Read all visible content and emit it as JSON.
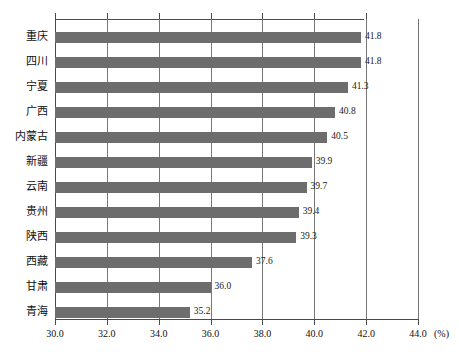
{
  "chart_data": {
    "type": "bar",
    "orientation": "horizontal",
    "title": "",
    "subtitle": "",
    "xlabel": "(%)",
    "ylabel": "",
    "categories": [
      "重庆",
      "四川",
      "宁夏",
      "广西",
      "内蒙古",
      "新疆",
      "云南",
      "贵州",
      "陕西",
      "西藏",
      "甘肃",
      "青海"
    ],
    "values": [
      41.8,
      41.8,
      41.3,
      40.8,
      40.5,
      39.9,
      39.7,
      39.4,
      39.3,
      37.6,
      36.0,
      35.2
    ],
    "data_labels": [
      "41.8",
      "41.8",
      "41.3",
      "40.8",
      "40.5",
      "39.9",
      "39.7",
      "39.4",
      "39.3",
      "37.6",
      "36.0",
      "35.2"
    ],
    "xlim": [
      30.0,
      44.0
    ],
    "xticks": [
      30.0,
      32.0,
      34.0,
      36.0,
      38.0,
      40.0,
      42.0,
      44.0
    ],
    "xtick_labels": [
      "30.0",
      "32.0",
      "34.0",
      "36.0",
      "38.0",
      "40.0",
      "42.0",
      "44.0"
    ],
    "unit_label": "(%)",
    "grid": true,
    "grid_axis": "x",
    "legend": null,
    "bar_color": "#6d6d6d",
    "axis_color": "#4a4a4a",
    "grid_color": "#777777",
    "background": "#ffffff"
  }
}
